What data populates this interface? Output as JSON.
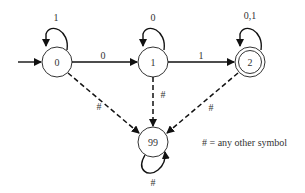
{
  "diagram": {
    "type": "finite-state-automaton",
    "start_state": "0",
    "states": [
      {
        "id": "0",
        "label": "0",
        "accepting": false
      },
      {
        "id": "1",
        "label": "1",
        "accepting": false
      },
      {
        "id": "2",
        "label": "2",
        "accepting": true
      },
      {
        "id": "99",
        "label": "99",
        "accepting": false
      }
    ],
    "transitions": [
      {
        "from": "0",
        "to": "0",
        "label": "1",
        "style": "solid"
      },
      {
        "from": "0",
        "to": "1",
        "label": "0",
        "style": "solid"
      },
      {
        "from": "1",
        "to": "1",
        "label": "0",
        "style": "solid"
      },
      {
        "from": "1",
        "to": "2",
        "label": "1",
        "style": "solid"
      },
      {
        "from": "2",
        "to": "2",
        "label": "0,1",
        "style": "solid"
      },
      {
        "from": "0",
        "to": "99",
        "label": "#",
        "style": "dashed"
      },
      {
        "from": "1",
        "to": "99",
        "label": "#",
        "style": "dashed"
      },
      {
        "from": "2",
        "to": "99",
        "label": "#",
        "style": "dashed"
      },
      {
        "from": "99",
        "to": "99",
        "label": "#",
        "style": "solid"
      }
    ],
    "legend": "# = any other symbol",
    "colors": {
      "stroke": "#222222",
      "text": "#333333",
      "background": "#ffffff"
    }
  }
}
